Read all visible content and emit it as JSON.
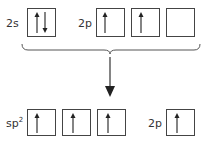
{
  "diagram": {
    "type": "orbital-hybridization",
    "top_row": {
      "groups": [
        {
          "label": "2s",
          "orbitals": [
            {
              "electrons": [
                "up",
                "down"
              ]
            }
          ]
        },
        {
          "label": "2p",
          "orbitals": [
            {
              "electrons": [
                "up"
              ]
            },
            {
              "electrons": [
                "up"
              ]
            },
            {
              "electrons": []
            }
          ]
        }
      ]
    },
    "bottom_row": {
      "groups": [
        {
          "label": "sp",
          "label_superscript": "2",
          "orbitals": [
            {
              "electrons": [
                "up"
              ]
            },
            {
              "electrons": [
                "up"
              ]
            },
            {
              "electrons": [
                "up"
              ]
            }
          ]
        },
        {
          "label": "2p",
          "orbitals": [
            {
              "electrons": [
                "up"
              ]
            }
          ]
        }
      ]
    },
    "connector": {
      "brace": "bottom-brace",
      "arrow": "down-arrow"
    },
    "colors": {
      "stroke": "#444444",
      "text": "#333333",
      "background": "#ffffff"
    }
  }
}
